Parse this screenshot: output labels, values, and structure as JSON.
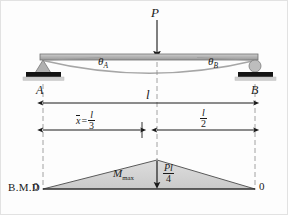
{
  "figure": {
    "type": "simply-supported-beam-bending-moment-diagram",
    "load_label": "P",
    "beam": {
      "support_a_label": "A",
      "support_b_label": "B",
      "support_a_type": "pinned-support",
      "support_b_type": "roller-support",
      "slope_a_label": "θ",
      "slope_a_sub": "A",
      "slope_b_label": "θ",
      "slope_b_sub": "B",
      "deflection_curve": "elastic-curve"
    },
    "dimensions": {
      "span_label": "l",
      "xbar_symbol": "x",
      "xbar_equals": "=",
      "xbar_num": "l",
      "xbar_den": "3",
      "half_num": "l",
      "half_den": "2"
    },
    "bmd": {
      "title": "B.M.D",
      "left_zero": "0",
      "right_zero": "0",
      "mmax_symbol": "M",
      "mmax_sub": "max",
      "peak_num": "Pl",
      "peak_den": "4"
    },
    "colors": {
      "ink": "#1a1a1a",
      "beam_fill": "#b9b9b9",
      "beam_edge": "#6f6f6f",
      "bmd_fill": "#d3d3d3",
      "bmd_edge": "#5a5a5a",
      "support_dark": "#111111",
      "dash_line": "#8a8a8a",
      "background": "#fdfdfd"
    }
  }
}
